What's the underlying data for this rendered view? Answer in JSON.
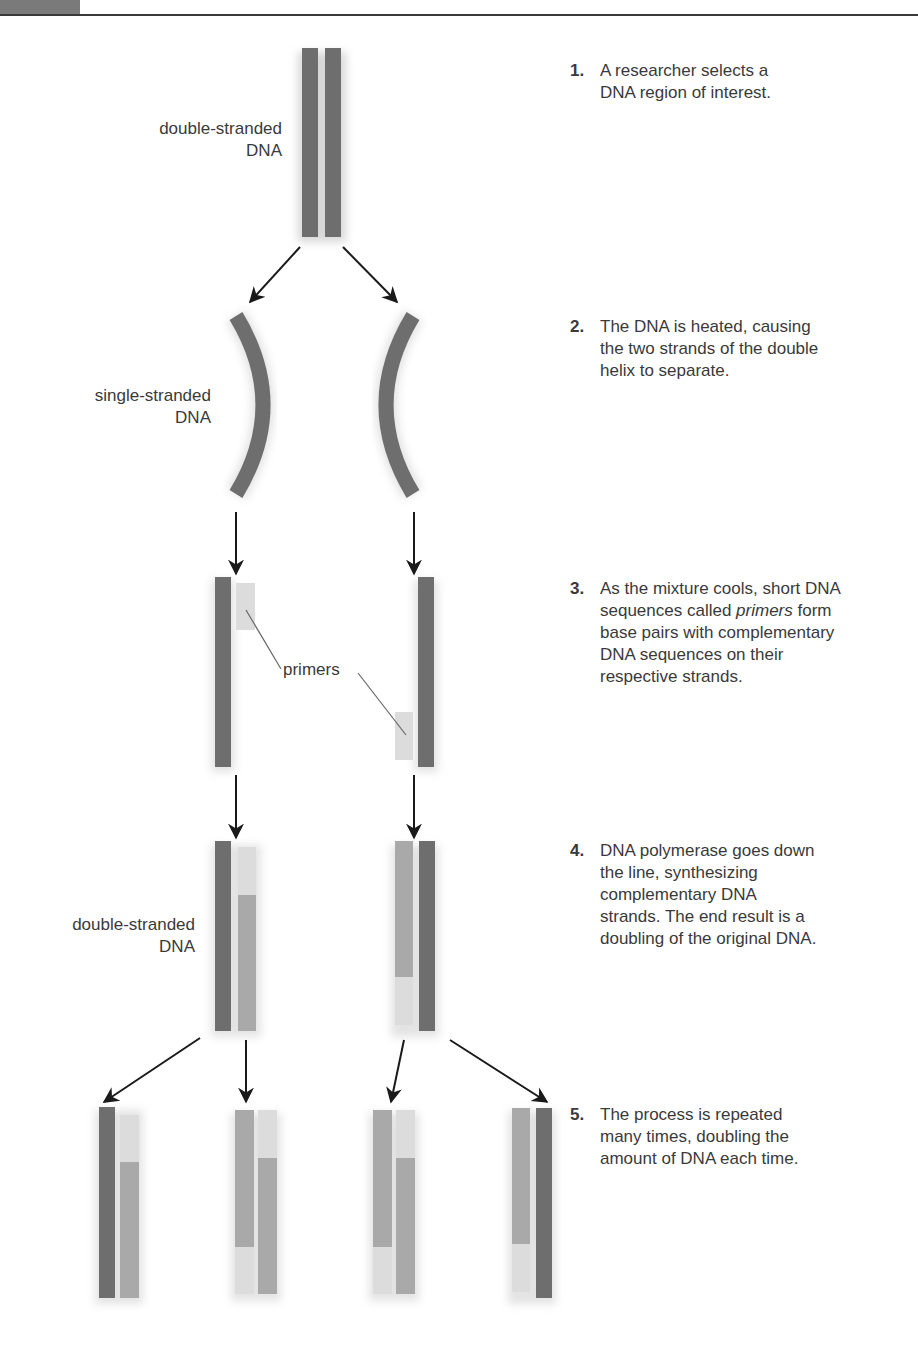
{
  "header": {
    "corner_color": "#7a7a7a",
    "rule_color": "#3a3a3a"
  },
  "labels": {
    "double_stranded_top": [
      "double-stranded",
      "DNA"
    ],
    "single_stranded": [
      "single-stranded",
      "DNA"
    ],
    "primers": "primers",
    "double_stranded_bottom": [
      "double-stranded",
      "DNA"
    ]
  },
  "steps": [
    {
      "num": "1.",
      "lines": [
        "A researcher selects a",
        "DNA region of interest."
      ]
    },
    {
      "num": "2.",
      "lines": [
        "The DNA is heated, causing",
        "the two strands of the double",
        "helix to separate."
      ]
    },
    {
      "num": "3.",
      "lines_html": [
        "As the mixture cools, short DNA",
        "sequences called ",
        "primers",
        " form",
        "base pairs with complementary",
        "DNA sequences on their",
        "respective strands."
      ]
    },
    {
      "num": "4.",
      "lines": [
        "DNA polymerase goes down",
        "the line, synthesizing",
        "complementary DNA",
        "strands. The end result is a",
        "doubling of the original DNA."
      ]
    },
    {
      "num": "5.",
      "lines": [
        "The process is repeated",
        "many times, doubling the",
        "amount of DNA each time."
      ]
    }
  ],
  "colors": {
    "original_strand": "#6e6e6e",
    "new_strand": "#a9a9a9",
    "primer": "#dcdcdc",
    "arrow": "#1a1a1a",
    "leader": "#666666"
  }
}
